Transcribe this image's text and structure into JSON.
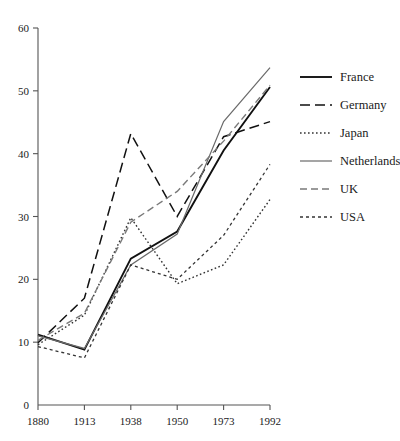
{
  "chart_data": {
    "type": "line",
    "title": "",
    "subtitle": "",
    "xlabel": "",
    "ylabel": "",
    "x": [
      "1880",
      "1913",
      "1938",
      "1950",
      "1973",
      "1992"
    ],
    "categories": [
      "1880",
      "1913",
      "1938",
      "1950",
      "1973",
      "1992"
    ],
    "xticklabels": [
      "1880",
      "1913",
      "1938",
      "1950",
      "1973",
      "1992"
    ],
    "yticklabels": [
      "0",
      "10",
      "20",
      "30",
      "40",
      "50",
      "60"
    ],
    "yticks": [
      0,
      10,
      20,
      30,
      40,
      50,
      60
    ],
    "ylim": [
      0,
      60
    ],
    "grid": false,
    "legend_position": "right",
    "series": [
      {
        "name": "France",
        "style": "solid",
        "color": "#111111",
        "width": 1.9,
        "dash": "none",
        "values": [
          11.2,
          8.8,
          23.3,
          27.6,
          40.5,
          50.6
        ]
      },
      {
        "name": "Germany",
        "style": "long-dash",
        "color": "#111111",
        "width": 1.5,
        "dash": "10,5",
        "values": [
          9.9,
          17.0,
          43.2,
          30.0,
          42.7,
          45.1
        ]
      },
      {
        "name": "Japan",
        "style": "dotted",
        "color": "#333333",
        "width": 1.4,
        "dash": "1.6,2.4",
        "values": [
          9.6,
          14.3,
          29.8,
          19.3,
          22.3,
          32.7
        ]
      },
      {
        "name": "Netherlands",
        "style": "solid-thin",
        "color": "#6a6a6a",
        "width": 1.2,
        "dash": "none",
        "values": [
          11.0,
          9.0,
          22.3,
          27.2,
          45.1,
          53.7
        ]
      },
      {
        "name": "UK",
        "style": "dash-dash",
        "color": "#7a7a7a",
        "width": 1.4,
        "dash": "7,4",
        "values": [
          10.3,
          14.6,
          29.1,
          34.0,
          42.0,
          50.9
        ]
      },
      {
        "name": "USA",
        "style": "short-dash",
        "color": "#333333",
        "width": 1.3,
        "dash": "3,3",
        "values": [
          9.3,
          7.5,
          22.3,
          20.0,
          27.0,
          38.3
        ]
      }
    ]
  },
  "legend": {
    "items": [
      {
        "label": "France"
      },
      {
        "label": "Germany"
      },
      {
        "label": "Japan"
      },
      {
        "label": "Netherlands"
      },
      {
        "label": "UK"
      },
      {
        "label": "USA"
      }
    ]
  }
}
